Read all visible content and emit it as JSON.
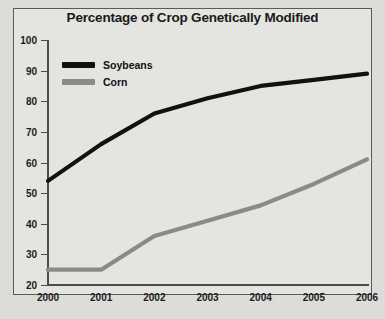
{
  "chart_data": {
    "type": "line",
    "title": "Percentage of Crop Genetically Modified",
    "xlabel": "",
    "ylabel": "",
    "categories": [
      "2000",
      "2001",
      "2002",
      "2003",
      "2004",
      "2005",
      "2006"
    ],
    "series": [
      {
        "name": "Soybeans",
        "color": "#111111",
        "values": [
          54,
          66,
          76,
          81,
          85,
          87,
          89
        ]
      },
      {
        "name": "Corn",
        "color": "#8a8a88",
        "values": [
          25,
          25,
          36,
          41,
          46,
          53,
          61
        ]
      }
    ],
    "ylim": [
      20,
      100
    ],
    "ytick_labels": [
      "100",
      "90",
      "80",
      "70",
      "60",
      "50",
      "40",
      "30",
      "20"
    ],
    "ytick_values": [
      100,
      90,
      80,
      70,
      60,
      50,
      40,
      30,
      20
    ],
    "grid": false,
    "legend_position": "top-left"
  },
  "legend": {
    "items": [
      {
        "label": "Soybeans",
        "color": "#111111"
      },
      {
        "label": "Corn",
        "color": "#8a8a88"
      }
    ]
  },
  "caption": {
    "text": ""
  }
}
